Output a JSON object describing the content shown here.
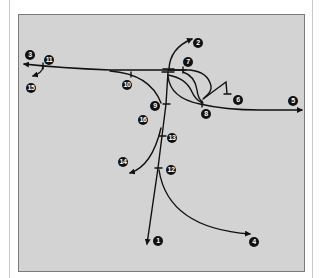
{
  "figure": {
    "background_color": "#d3d3d3",
    "line_color": "#111111",
    "callouts": [
      {
        "id": "1",
        "text": "1",
        "x": 153,
        "y": 236
      },
      {
        "id": "2",
        "text": "2",
        "x": 193,
        "y": 38
      },
      {
        "id": "3",
        "text": "3",
        "x": 25,
        "y": 50
      },
      {
        "id": "4",
        "text": "4",
        "x": 249,
        "y": 237
      },
      {
        "id": "5",
        "text": "5",
        "x": 288,
        "y": 96
      },
      {
        "id": "6",
        "text": "6",
        "x": 233,
        "y": 95
      },
      {
        "id": "7",
        "text": "7",
        "x": 183,
        "y": 57
      },
      {
        "id": "8",
        "text": "8",
        "x": 201,
        "y": 109
      },
      {
        "id": "9",
        "text": "9",
        "x": 150,
        "y": 101
      },
      {
        "id": "10",
        "text": "10",
        "x": 122,
        "y": 80
      },
      {
        "id": "11",
        "text": "11",
        "x": 44,
        "y": 55
      },
      {
        "id": "12",
        "text": "12",
        "x": 166,
        "y": 165
      },
      {
        "id": "13",
        "text": "13",
        "x": 167,
        "y": 133
      },
      {
        "id": "14",
        "text": "14",
        "x": 118,
        "y": 157
      },
      {
        "id": "15",
        "text": "15",
        "x": 26,
        "y": 83
      },
      {
        "id": "16",
        "text": "16",
        "x": 138,
        "y": 115
      }
    ]
  }
}
